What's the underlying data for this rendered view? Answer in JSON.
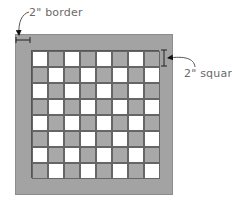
{
  "diagram": {
    "labels": {
      "border": "2\" border",
      "squares": "2\" squares"
    },
    "board": {
      "rows": 8,
      "cols": 8,
      "top_left_color": "light",
      "colors": {
        "border": "#a3a3a3",
        "dark_square": "#a8a8a8",
        "light_square": "#ffffff",
        "grid_line": "#555555",
        "annotation": "#6a6a6a"
      }
    }
  }
}
